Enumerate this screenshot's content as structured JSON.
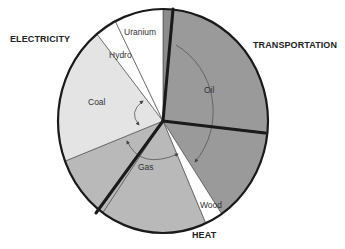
{
  "chart_data": {
    "type": "pie",
    "title": "",
    "sectors": [
      {
        "name": "ELECTRICITY",
        "slices": [
          "Oil (electricity)",
          "Gas (electricity)",
          "Coal",
          "Hydro",
          "Uranium"
        ]
      },
      {
        "name": "TRANSPORTATION",
        "slices": [
          "Oil (transportation)"
        ]
      },
      {
        "name": "HEAT",
        "slices": [
          "Oil (heat)",
          "Wood",
          "Gas (heat)"
        ]
      }
    ],
    "slices": [
      {
        "label": "Oil",
        "sector": "ELECTRICITY",
        "percent": 1.6,
        "start_deg": 0,
        "end_deg": 6,
        "color": "#8c8c8c"
      },
      {
        "label": "Oil",
        "sector": "TRANSPORTATION",
        "percent": 25.0,
        "start_deg": 6,
        "end_deg": 96,
        "color": "#9a9a9a"
      },
      {
        "label": "Oil",
        "sector": "HEAT",
        "percent": 13.9,
        "start_deg": 96,
        "end_deg": 146,
        "color": "#9a9a9a"
      },
      {
        "label": "Wood",
        "sector": "HEAT",
        "percent": 2.8,
        "start_deg": 146,
        "end_deg": 156,
        "color": "#ffffff"
      },
      {
        "label": "Gas",
        "sector": "HEAT",
        "percent": 16.4,
        "start_deg": 156,
        "end_deg": 215,
        "color": "#b9b9b9"
      },
      {
        "label": "Gas",
        "sector": "ELECTRICITY",
        "percent": 9.4,
        "start_deg": 215,
        "end_deg": 249,
        "color": "#b9b9b9"
      },
      {
        "label": "Coal",
        "sector": "ELECTRICITY",
        "percent": 20.0,
        "start_deg": 249,
        "end_deg": 321,
        "color": "#e4e4e4"
      },
      {
        "label": "Hydro",
        "sector": "ELECTRICITY",
        "percent": 3.3,
        "start_deg": 321,
        "end_deg": 333,
        "color": "#ffffff"
      },
      {
        "label": "Uranium",
        "sector": "ELECTRICITY",
        "percent": 7.5,
        "start_deg": 333,
        "end_deg": 360,
        "color": "#ffffff"
      }
    ],
    "legend": "none",
    "annotations": [
      "Curved arrow spanning Oil slices",
      "Curved arrow spanning Gas slices",
      "Double arrow between Coal and Gas"
    ]
  },
  "labels": {
    "electricity": "ELECTRICITY",
    "transportation": "TRANSPORTATION",
    "heat": "HEAT",
    "oil": "Oil",
    "gas": "Gas",
    "coal": "Coal",
    "hydro": "Hydro",
    "uranium": "Uranium",
    "wood": "Wood"
  }
}
